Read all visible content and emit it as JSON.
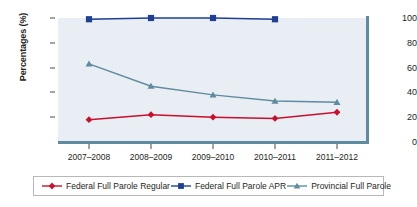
{
  "chart_data": {
    "type": "line",
    "title": "",
    "xlabel": "",
    "ylabel": "Percentages (%)",
    "categories": [
      "2007–2008",
      "2008–2009",
      "2009–2010",
      "2010–2011",
      "2011–2012"
    ],
    "ylim": [
      0,
      100
    ],
    "yticks": [
      0,
      20,
      40,
      60,
      80,
      100
    ],
    "ytick_labels": [
      "0",
      "20",
      "40",
      "60",
      "80",
      "100"
    ],
    "grid": false,
    "legend_position": "bottom",
    "series": [
      {
        "name": "Federal Full Parole Regular",
        "color": "#c8102e",
        "marker": "diamond",
        "values": [
          18,
          22,
          20,
          19,
          24
        ]
      },
      {
        "name": "Federal Full Parole APR",
        "color": "#1f3f93",
        "marker": "square",
        "values": [
          99,
          100,
          100,
          99,
          null
        ]
      },
      {
        "name": "Provincial Full Parole",
        "color": "#5f8ba0",
        "marker": "triangle",
        "values": [
          63,
          45,
          38,
          33,
          32
        ]
      }
    ]
  },
  "axis": {
    "y_title": "Percentages (%)"
  },
  "legend": {
    "items": [
      {
        "label": "Federal Full Parole Regular"
      },
      {
        "label": "Federal Full Parole APR"
      },
      {
        "label": "Provincial Full Parole"
      }
    ]
  },
  "colors": {
    "plot_background": "#e9eef5",
    "axis_line": "#5f8ba0",
    "series_regular": "#c8102e",
    "series_apr": "#1f3f93",
    "series_provincial": "#5f8ba0"
  }
}
